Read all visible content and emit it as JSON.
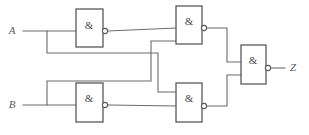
{
  "diagram": {
    "type": "logic-circuit-schematic",
    "colors": {
      "background": "#ffffff",
      "wire": "#6b6b6b",
      "gate_outline": "#5a5a5a",
      "gate_fill": "#ffffff",
      "text": "#5a5a5a"
    },
    "inputs": [
      {
        "id": "A",
        "label": "A",
        "x": 12,
        "y": 31
      },
      {
        "id": "B",
        "label": "B",
        "x": 12,
        "y": 105
      }
    ],
    "outputs": [
      {
        "id": "Z",
        "label": "Z",
        "x": 293,
        "y": 68
      }
    ],
    "gates": [
      {
        "id": "g1",
        "symbol": "&",
        "kind": "nand",
        "x": 76,
        "y": 9,
        "w": 27,
        "h": 38,
        "symbol_x": 89,
        "symbol_y": 26,
        "bubble_x": 105,
        "bubble_y": 31,
        "bubble_r": 2.6,
        "inputs_y": [
          31
        ],
        "output_y": 31
      },
      {
        "id": "g2",
        "symbol": "&",
        "kind": "nand",
        "x": 176,
        "y": 6,
        "w": 26,
        "h": 38,
        "symbol_x": 189,
        "symbol_y": 22,
        "bubble_x": 204,
        "bubble_y": 28,
        "bubble_r": 2.6,
        "inputs_y": [
          28,
          41
        ],
        "output_y": 28
      },
      {
        "id": "g3",
        "symbol": "&",
        "kind": "nand",
        "x": 76,
        "y": 83,
        "w": 27,
        "h": 39,
        "symbol_x": 89,
        "symbol_y": 99,
        "bubble_x": 105,
        "bubble_y": 105,
        "bubble_r": 2.6,
        "inputs_y": [
          105
        ],
        "output_y": 105
      },
      {
        "id": "g4",
        "symbol": "&",
        "kind": "nand",
        "x": 176,
        "y": 83,
        "w": 26,
        "h": 39,
        "symbol_x": 189,
        "symbol_y": 99,
        "bubble_x": 204,
        "bubble_y": 106,
        "bubble_r": 2.6,
        "inputs_y": [
          92,
          106
        ],
        "output_y": 106
      },
      {
        "id": "g5",
        "symbol": "&",
        "kind": "nand",
        "x": 241,
        "y": 45,
        "w": 25,
        "h": 39,
        "symbol_x": 253,
        "symbol_y": 61,
        "bubble_x": 268,
        "bubble_y": 68,
        "bubble_r": 2.6,
        "inputs_y": [
          62,
          75
        ],
        "output_y": 68
      }
    ],
    "nets": [
      {
        "id": "net-a-main",
        "from": "A",
        "to": "g1.in",
        "path": "M 23 31 L 76 31"
      },
      {
        "id": "net-a-branch",
        "from": "A",
        "to": "g4.in-upper",
        "path": "M 47 31 L 47 53 L 158 53 L 158 92 L 176 92"
      },
      {
        "id": "net-b-main",
        "from": "B",
        "to": "g3.in",
        "path": "M 23 105 L 76 105"
      },
      {
        "id": "net-b-branch",
        "from": "B",
        "to": "g2.in-lower",
        "path": "M 47 105 L 47 81 L 151 81 L 151 41 L 176 41"
      },
      {
        "id": "net-g1-to-g2",
        "from": "g1.out",
        "to": "g2.in-upper",
        "path": "M 108 31 L 176 28"
      },
      {
        "id": "net-g3-to-g4",
        "from": "g3.out",
        "to": "g4.in-lower",
        "path": "M 108 105 L 176 106"
      },
      {
        "id": "net-g2-to-g5",
        "from": "g2.out",
        "to": "g5.in-upper",
        "path": "M 207 28 L 227 28 L 227 62 L 241 62"
      },
      {
        "id": "net-g4-to-g5",
        "from": "g4.out",
        "to": "g5.in-lower",
        "path": "M 207 106 L 227 106 L 227 75 L 241 75"
      },
      {
        "id": "net-g5-to-z",
        "from": "g5.out",
        "to": "Z",
        "path": "M 271 68 L 285 68"
      }
    ]
  }
}
